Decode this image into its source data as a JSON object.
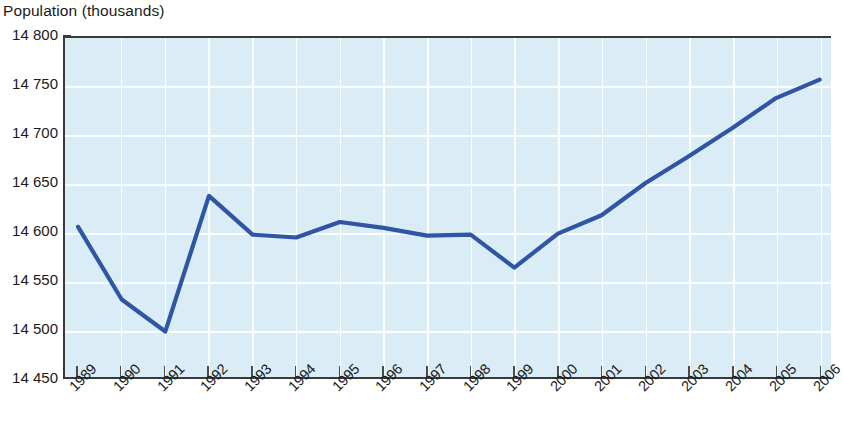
{
  "chart_data": {
    "type": "line",
    "title": "Population (thousands)",
    "ylabel": "Population (thousands)",
    "xlabel": "",
    "categories": [
      "1989",
      "1990",
      "1991",
      "1992",
      "1993",
      "1994",
      "1995",
      "1996",
      "1997",
      "1998",
      "1999",
      "2000",
      "2001",
      "2002",
      "2003",
      "2004",
      "2005",
      "2006"
    ],
    "values": [
      14605,
      14530,
      14497,
      14637,
      14597,
      14594,
      14610,
      14604,
      14596,
      14597,
      14563,
      14598,
      14617,
      14650,
      14678,
      14707,
      14738,
      14757
    ],
    "series": [
      {
        "name": "Population",
        "values": [
          14605,
          14530,
          14497,
          14637,
          14597,
          14594,
          14610,
          14604,
          14596,
          14597,
          14563,
          14598,
          14617,
          14650,
          14678,
          14707,
          14738,
          14757
        ]
      }
    ],
    "ylim": [
      14450,
      14800
    ],
    "yticks": [
      14450,
      14500,
      14550,
      14600,
      14650,
      14700,
      14750,
      14800
    ],
    "ytick_labels": [
      "14 450",
      "14 500",
      "14 550",
      "14 600",
      "14 650",
      "14 700",
      "14 750",
      "14 800"
    ],
    "grid": true,
    "grid_color": "#ffffff",
    "legend": null,
    "line_color": "#2f55a4",
    "plot_background": "#daedf7",
    "axis_color": "#3a3a3a",
    "xtick_rotation": -45
  },
  "colors": {
    "line": "#2f55a4",
    "plot_bg": "#daedf7",
    "grid": "#ffffff",
    "axis": "#3a3a3a",
    "text": "#1a1a1a",
    "page_bg": "#ffffff"
  }
}
